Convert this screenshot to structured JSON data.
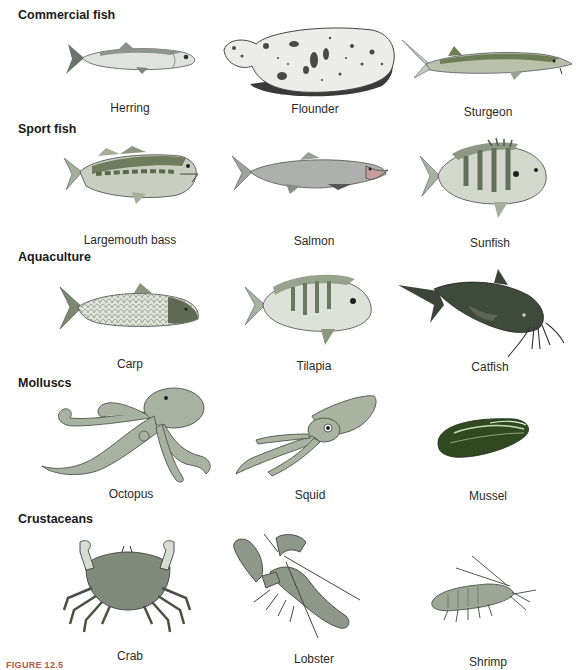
{
  "sections": [
    {
      "title": "Commercial fish",
      "items": [
        {
          "name": "Herring"
        },
        {
          "name": "Flounder"
        },
        {
          "name": "Sturgeon"
        }
      ]
    },
    {
      "title": "Sport fish",
      "items": [
        {
          "name": "Largemouth bass"
        },
        {
          "name": "Salmon"
        },
        {
          "name": "Sunfish"
        }
      ]
    },
    {
      "title": "Aquaculture",
      "items": [
        {
          "name": "Carp"
        },
        {
          "name": "Tilapia"
        },
        {
          "name": "Catfish"
        }
      ]
    },
    {
      "title": "Molluscs",
      "items": [
        {
          "name": "Octopus"
        },
        {
          "name": "Squid"
        },
        {
          "name": "Mussel"
        }
      ]
    },
    {
      "title": "Crustaceans",
      "items": [
        {
          "name": "Crab"
        },
        {
          "name": "Lobster"
        },
        {
          "name": "Shrimp"
        }
      ]
    }
  ],
  "caption": "FIGURE 12.5",
  "colors": {
    "herring_body": "#d8dcd8",
    "olive_green": "#7d8c6c",
    "gray_green": "#a7b19e",
    "salmon_body": "#a9aba8",
    "catfish": "#3c4538",
    "mussel": "#2f4a22",
    "octopus": "#a9b3a2",
    "crab": "#808a7c",
    "caption_color": "#b0594a"
  }
}
